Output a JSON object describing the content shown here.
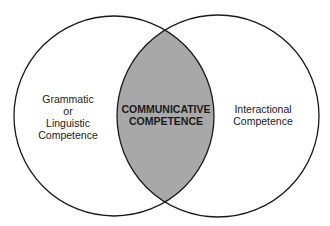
{
  "diagram": {
    "type": "venn",
    "colors": {
      "background": "#ffffff",
      "outline": "#1a1a1a",
      "intersection_fill": "#a8a8a8"
    },
    "left_circle": {
      "label_lines": [
        "Grammatic",
        "or",
        "Linguistic",
        "Competence"
      ]
    },
    "right_circle": {
      "label_lines": [
        "Interactional",
        "Competence"
      ]
    },
    "intersection": {
      "label_lines": [
        "COMMUNICATIVE",
        "COMPETENCE"
      ]
    }
  }
}
